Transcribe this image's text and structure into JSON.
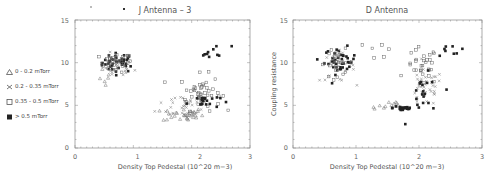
{
  "legend": {
    "items": [
      {
        "marker": "triangle",
        "label": "0 - 0.2 mTorr"
      },
      {
        "marker": "cross",
        "label": "0.2 - 0.35 mTorr"
      },
      {
        "marker": "square",
        "label": "0.35 - 0.5 mTorr"
      },
      {
        "marker": "filled-square",
        "label": "> 0.5  mTorr"
      }
    ]
  },
  "chart_data": [
    {
      "type": "scatter",
      "title": "J Antenna - 3",
      "xlabel": "Density Top Pedestal (10^20 m^-3)",
      "xlabel_display": "Density Top Pedestal (10^20 m^-3)",
      "ylabel": "",
      "xlim": [
        0,
        3
      ],
      "ylim": [
        0,
        15
      ],
      "xticks": [
        "0",
        "1",
        "2",
        "3"
      ],
      "yticks": [
        "0",
        "5",
        "10",
        "15"
      ],
      "grid": false,
      "legend_position": "left-outside",
      "clusters": [
        {
          "series": "> 0.5 mTorr",
          "x_center": 0.75,
          "y_center": 10.0,
          "x_spread": 0.2,
          "y_spread": 0.8,
          "n": 40
        },
        {
          "series": "0.35 - 0.5 mTorr",
          "x_center": 0.7,
          "y_center": 10.0,
          "x_spread": 0.2,
          "y_spread": 0.8,
          "n": 30
        },
        {
          "series": "0.2 - 0.35 mTorr",
          "x_center": 0.7,
          "y_center": 9.5,
          "x_spread": 0.22,
          "y_spread": 1.0,
          "n": 25
        },
        {
          "series": "0 - 0.2 mTorr",
          "x_center": 0.55,
          "y_center": 8.0,
          "x_spread": 0.1,
          "y_spread": 0.8,
          "n": 6
        },
        {
          "series": "0 - 0.2 mTorr",
          "x_center": 1.85,
          "y_center": 3.9,
          "x_spread": 0.25,
          "y_spread": 0.6,
          "n": 30
        },
        {
          "series": "0.2 - 0.35 mTorr",
          "x_center": 1.9,
          "y_center": 5.0,
          "x_spread": 0.35,
          "y_spread": 1.2,
          "n": 35
        },
        {
          "series": "0.35 - 0.5 mTorr",
          "x_center": 2.15,
          "y_center": 6.5,
          "x_spread": 0.25,
          "y_spread": 1.5,
          "n": 45
        },
        {
          "series": "> 0.5 mTorr",
          "x_center": 2.2,
          "y_center": 5.5,
          "x_spread": 0.2,
          "y_spread": 0.6,
          "n": 20
        },
        {
          "series": "> 0.5 mTorr",
          "x_center": 2.4,
          "y_center": 11.2,
          "x_spread": 0.2,
          "y_spread": 0.6,
          "n": 10
        }
      ]
    },
    {
      "type": "scatter",
      "title": "D Antenna",
      "xlabel": "Density Top Pedestal (10^20 m^-3)",
      "ylabel": "Coupling resistance",
      "xlim": [
        0,
        3
      ],
      "ylim": [
        0,
        15
      ],
      "xticks": [
        "0",
        "1",
        "2",
        "3"
      ],
      "yticks": [
        "0",
        "5",
        "10",
        "15"
      ],
      "grid": false,
      "clusters": [
        {
          "series": "> 0.5 mTorr",
          "x_center": 0.75,
          "y_center": 10.2,
          "x_spread": 0.18,
          "y_spread": 1.1,
          "n": 40
        },
        {
          "series": "0.35 - 0.5 mTorr",
          "x_center": 0.7,
          "y_center": 10.0,
          "x_spread": 0.2,
          "y_spread": 1.1,
          "n": 25
        },
        {
          "series": "0.2 - 0.35 mTorr",
          "x_center": 0.7,
          "y_center": 9.5,
          "x_spread": 0.2,
          "y_spread": 1.2,
          "n": 25
        },
        {
          "series": "0 - 0.2 mTorr",
          "x_center": 1.5,
          "y_center": 5.0,
          "x_spread": 0.2,
          "y_spread": 0.5,
          "n": 12
        },
        {
          "series": "> 0.5 mTorr",
          "x_center": 1.75,
          "y_center": 4.7,
          "x_spread": 0.12,
          "y_spread": 0.3,
          "n": 20
        },
        {
          "series": "0.2 - 0.35 mTorr",
          "x_center": 2.1,
          "y_center": 7.0,
          "x_spread": 0.2,
          "y_spread": 1.5,
          "n": 40
        },
        {
          "series": "0.35 - 0.5 mTorr",
          "x_center": 2.05,
          "y_center": 9.5,
          "x_spread": 0.18,
          "y_spread": 1.6,
          "n": 30
        },
        {
          "series": "> 0.5 mTorr",
          "x_center": 2.1,
          "y_center": 6.0,
          "x_spread": 0.2,
          "y_spread": 1.8,
          "n": 20
        },
        {
          "series": "> 0.5 mTorr",
          "x_center": 2.55,
          "y_center": 11.5,
          "x_spread": 0.2,
          "y_spread": 1.0,
          "n": 8
        },
        {
          "series": "0.35 - 0.5 mTorr",
          "x_center": 1.4,
          "y_center": 11.5,
          "x_spread": 0.15,
          "y_spread": 0.8,
          "n": 6
        }
      ]
    }
  ],
  "labels": {
    "left_title": "J Antenna  –  3",
    "right_title": "D Antenna",
    "xlabel": "Density Top Pedestal (10^20 m−3)",
    "right_ylabel": "Coupling resistance",
    "xticks": [
      "0",
      "1",
      "2",
      "3"
    ],
    "yticks": [
      "0",
      "5",
      "10",
      "15"
    ]
  }
}
